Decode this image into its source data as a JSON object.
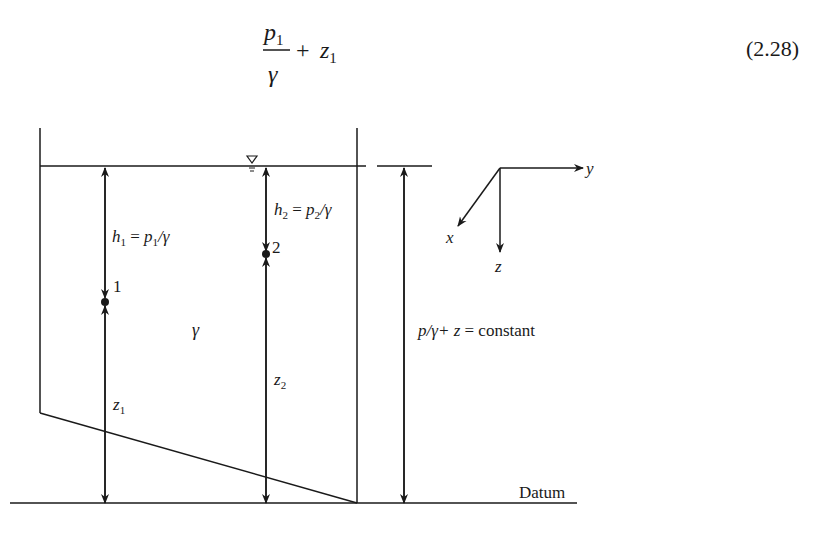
{
  "equation": {
    "numerator": "p",
    "numerator_sub": "1",
    "denominator": "γ",
    "plus": "+",
    "term": "z",
    "term_sub": "1",
    "number": "(2.28)"
  },
  "diagram": {
    "free_surface_symbol": "∇",
    "h1_label": {
      "h": "h",
      "sub": "1",
      "eq": " = ",
      "p": "p",
      "psub": "1",
      "slash": "/γ"
    },
    "h2_label": {
      "h": "h",
      "sub": "2",
      "eq": " = ",
      "p": "p",
      "psub": "2",
      "slash": "/γ"
    },
    "point1_label": "1",
    "point2_label": "2",
    "fluid_label": "γ",
    "z1_label": {
      "z": "z",
      "sub": "1"
    },
    "z2_label": {
      "z": "z",
      "sub": "2"
    },
    "constant_label": {
      "lhs": "p/γ+ z",
      "eq": " = constant"
    },
    "datum_label": "Datum",
    "axes": {
      "x": "x",
      "y": "y",
      "z": "z"
    }
  }
}
